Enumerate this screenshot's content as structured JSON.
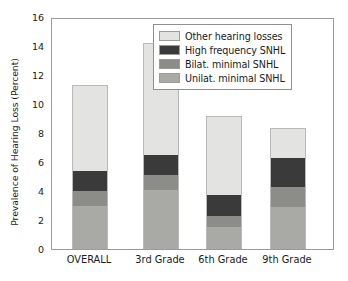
{
  "chart_data": {
    "type": "bar",
    "subtype": "stacked-vertical",
    "title": "",
    "xlabel": "",
    "ylabel": "Prevalence of Hearing Loss (Percent)",
    "ylim": [
      0,
      16
    ],
    "yticks": [
      0,
      2,
      4,
      6,
      8,
      10,
      12,
      14,
      16
    ],
    "ytick_labels": [
      "0",
      "2",
      "4",
      "6",
      "8",
      "10",
      "12",
      "14",
      "16"
    ],
    "grid": false,
    "legend_position": "upper right",
    "categories": [
      "OVERALL",
      "3rd Grade",
      "6th Grade",
      "9th Grade"
    ],
    "series": [
      {
        "name": "Unilat. minimal SNHL",
        "color": "#a9a9a6",
        "values": [
          3.0,
          4.1,
          1.5,
          2.9
        ]
      },
      {
        "name": "Bilat. minimal SNHL",
        "color": "#8c8c89",
        "values": [
          1.0,
          1.0,
          0.8,
          1.35
        ]
      },
      {
        "name": "High frequency SNHL",
        "color": "#3a3a3a",
        "values": [
          1.4,
          1.4,
          1.45,
          2.0
        ]
      },
      {
        "name": "Other hearing losses",
        "color": "#e3e3e1",
        "values": [
          5.9,
          7.7,
          5.45,
          2.1
        ]
      }
    ],
    "totals": [
      11.3,
      14.2,
      9.2,
      8.35
    ],
    "legend_order_top_to_bottom": [
      "Other hearing losses",
      "High frequency SNHL",
      "Bilat. minimal SNHL",
      "Unilat. minimal SNHL"
    ]
  },
  "axis": {
    "frame_color": "#9a9a9a",
    "tick_color": "#8a8a8a",
    "text_color": "#1a1a1a"
  }
}
